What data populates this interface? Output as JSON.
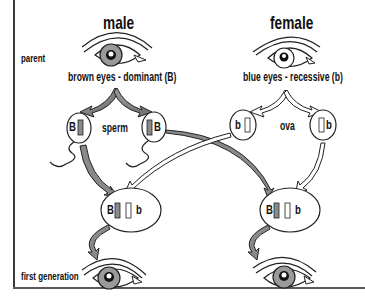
{
  "columns": {
    "male": "male",
    "female": "female"
  },
  "row_labels": {
    "parent": "parent",
    "first_generation": "first generation"
  },
  "parents": {
    "male_trait": "brown eyes - dominant (B)",
    "female_trait": "blue eyes - recessive (b)"
  },
  "gametes": {
    "male_label": "sperm",
    "female_label": "ova",
    "sperm": [
      {
        "allele": "B"
      },
      {
        "allele": "B"
      }
    ],
    "ova": [
      {
        "allele": "b"
      },
      {
        "allele": "b"
      }
    ]
  },
  "offspring": [
    {
      "genotype_dominant": "B",
      "genotype_recessive": "b"
    },
    {
      "genotype_dominant": "B",
      "genotype_recessive": "b"
    }
  ],
  "colors": {
    "dominant_gray": "#8a8a8a",
    "iris_gray": "#9a9a9a",
    "line": "#222222",
    "frame": "#3a3a3a"
  }
}
